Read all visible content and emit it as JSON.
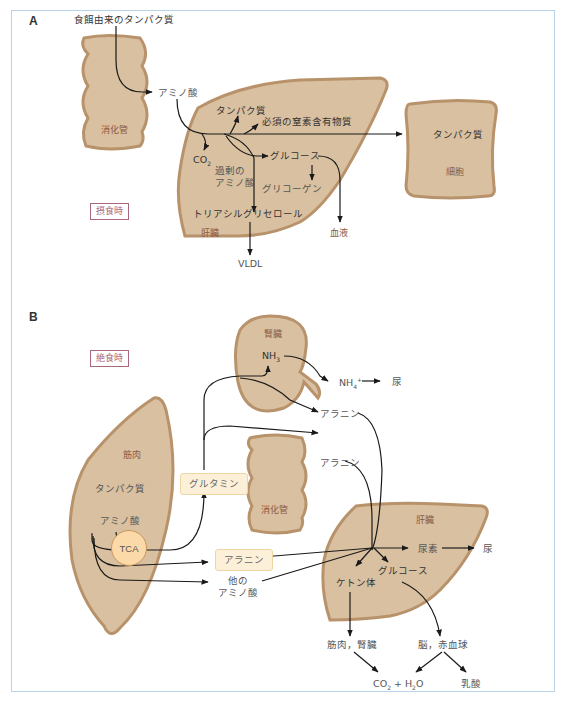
{
  "colors": {
    "organ_fill": "#d9c0a0",
    "organ_border": "#b8926a",
    "frame_border": "#b9d3ea",
    "state_box": "#a8687a",
    "molecule_box_fill": "#fdf0d8",
    "tca_fill": "#fcd9a8",
    "arrow": "#1a1a1a"
  },
  "panel_a": {
    "letter": "A",
    "state": "摂食時",
    "organs": {
      "digestive_tract": "消化管",
      "liver": "肝臓",
      "cell": "細胞"
    },
    "labels": {
      "dietary_protein": "食餌由来のタンパク質",
      "amino_acid": "アミノ酸",
      "protein_liver": "タンパク質",
      "essential_nitrogen": "必須の窒素含有物質",
      "co2": "CO",
      "co2_sub": "2",
      "excess_amino_acid_1": "過剰の",
      "excess_amino_acid_2": "アミノ酸",
      "glucose": "グルコース",
      "glycogen": "グリコーゲン",
      "triacylglycerol": "トリアシルグリセロール",
      "blood": "血液",
      "vldl": "VLDL",
      "protein_cell": "タンパク質"
    }
  },
  "panel_b": {
    "letter": "B",
    "state": "絶食時",
    "organs": {
      "kidney": "腎臓",
      "muscle": "筋肉",
      "digestive_tract": "消化管",
      "liver": "肝臓"
    },
    "labels": {
      "nh3": "NH",
      "nh3_sub": "3",
      "nh4": "NH",
      "nh4_sub": "4",
      "nh4_sup": "+",
      "urine_kidney": "尿",
      "alanine_kidney": "アラニン",
      "alanine_gut": "アラニン",
      "protein_muscle": "タンパク質",
      "amino_acid_muscle": "アミノ酸",
      "glutamine": "グルタミン",
      "tca": "TCA",
      "alanine_box": "アラニン",
      "other_amino_acid_1": "他の",
      "other_amino_acid_2": "アミノ酸",
      "urea": "尿素",
      "urine_liver": "尿",
      "ketone_bodies": "ケトン体",
      "glucose": "グルコース",
      "muscle_kidney": "筋肉，腎臓",
      "brain_rbc": "脳，赤血球",
      "co2_h2o_a": "CO",
      "co2_h2o_sub1": "2",
      "co2_h2o_b": " + H",
      "co2_h2o_sub2": "2",
      "co2_h2o_c": "O",
      "lactate": "乳酸"
    }
  }
}
